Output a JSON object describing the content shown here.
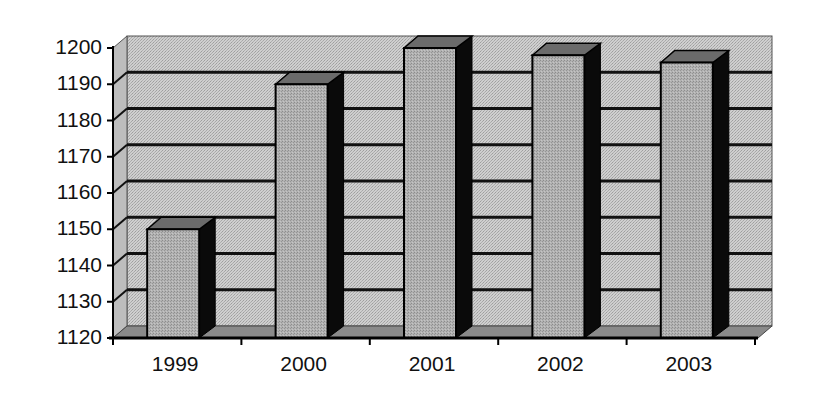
{
  "chart_data": {
    "type": "bar",
    "style": "3d-column",
    "title": "",
    "xlabel": "",
    "ylabel": "",
    "categories": [
      "1999",
      "2000",
      "2001",
      "2002",
      "2003"
    ],
    "values": [
      1150,
      1190,
      1200,
      1198,
      1196
    ],
    "ylim": [
      1120,
      1200
    ],
    "yticks": [
      "1120",
      "1130",
      "1140",
      "1150",
      "1160",
      "1170",
      "1180",
      "1190",
      "1200"
    ],
    "grid": true,
    "legend": "none"
  },
  "colors": {
    "wall": "#c9c9c9",
    "floor": "#8a8a8a",
    "bar_front": "#a9a9a9",
    "bar_top": "#6b6b6b",
    "bar_side": "#0a0a0a",
    "gridline": "#111111"
  }
}
